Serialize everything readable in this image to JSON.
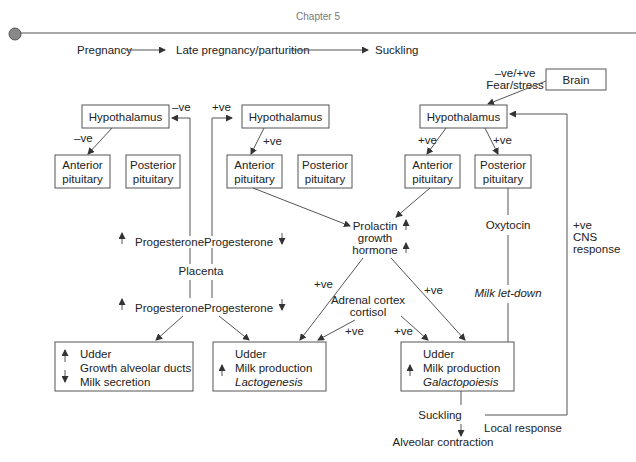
{
  "header": {
    "chapter": "Chapter 5"
  },
  "timeline": {
    "stages": [
      "Pregnancy",
      "Late pregnancy/parturition",
      "Suckling"
    ]
  },
  "pregnancy": {
    "hypothalamus": "Hypothalamus",
    "hyp_to_ant_label": "–ve",
    "feedback_label": "–ve",
    "anterior": [
      "Anterior",
      "pituitary"
    ],
    "posterior": [
      "Posterior",
      "pituitary"
    ],
    "progesterone_top": "Progesterone",
    "placenta": "Placenta",
    "progesterone_bottom": "Progesterone",
    "udder_box": [
      "Udder",
      "Growth alveolar ducts",
      "Milk secretion"
    ]
  },
  "late_pregnancy": {
    "feedback_label": "+ve",
    "hypothalamus": "Hypothalamus",
    "hyp_to_ant_label": "+ve",
    "anterior": [
      "Anterior",
      "pituitary"
    ],
    "posterior": [
      "Posterior",
      "pituitary"
    ],
    "progesterone_top": "Progesterone",
    "progesterone_bottom": "Progesterone",
    "udder_box": [
      "Udder",
      "Milk production",
      "Lactogenesis"
    ]
  },
  "suckling": {
    "brain": "Brain",
    "brain_label": [
      "–ve/+ve",
      "Fear/stress"
    ],
    "hypothalamus": "Hypothalamus",
    "hyp_to_ant_label": "+ve",
    "hyp_to_post_label": "+ve",
    "anterior": [
      "Anterior",
      "pituitary"
    ],
    "posterior": [
      "Posterior",
      "pituitary"
    ],
    "oxytocin": "Oxytocin",
    "milk_letdown": "Milk let-down",
    "cns_label": [
      "+ve",
      "CNS",
      "response"
    ],
    "udder_box": [
      "Udder",
      "Milk production",
      "Galactopoiesis"
    ],
    "suckling_label": "Suckling",
    "local_response": "Local response",
    "alveolar_contraction": "Alveolar contraction"
  },
  "center": {
    "prolactin": [
      "Prolactin",
      "growth",
      "hormone"
    ],
    "prolactin_to_lacto_label": "+ve",
    "prolactin_to_galacto_label": "+ve",
    "adrenal": [
      "Adrenal cortex",
      "cortisol"
    ],
    "adrenal_to_lacto_label": "+ve",
    "adrenal_to_galacto_label": "+ve"
  }
}
